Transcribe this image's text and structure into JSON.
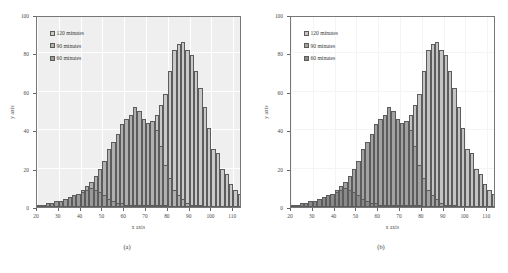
{
  "figure": {
    "panels": [
      {
        "caption": "(a)",
        "background": "#efefef",
        "legend": [
          {
            "label": "120 minutes",
            "color": "#c9c9c9"
          },
          {
            "label": "90 minutes",
            "color": "#b0b0b0"
          },
          {
            "label": "60 minutes",
            "color": "#9a9a9a"
          }
        ],
        "chart_data": {
          "type": "bar",
          "title": "",
          "subtitle": "",
          "xlabel": "x axis",
          "ylabel": "y axis",
          "xlim": [
            20,
            114
          ],
          "ylim": [
            0,
            100
          ],
          "xticks": [
            20,
            30,
            40,
            50,
            60,
            70,
            80,
            90,
            100,
            110
          ],
          "yticks": [
            0,
            20,
            40,
            60,
            80,
            100
          ],
          "grid": true,
          "legend_position": "top-left",
          "bin_width": 2,
          "x": [
            21,
            23,
            25,
            27,
            29,
            31,
            33,
            35,
            37,
            39,
            41,
            43,
            45,
            47,
            49,
            51,
            53,
            55,
            57,
            59,
            61,
            63,
            65,
            67,
            69,
            71,
            73,
            75,
            77,
            79,
            81,
            83,
            85,
            87,
            89,
            91,
            93,
            95,
            97,
            99,
            101,
            103,
            105,
            107,
            109,
            111,
            113
          ],
          "series": [
            {
              "name": "120 minutes",
              "color": "#c9c9c9",
              "values": [
                1,
                1,
                2,
                2,
                3,
                3,
                4,
                5,
                6,
                7,
                9,
                11,
                13,
                16,
                20,
                24,
                30,
                34,
                38,
                43,
                46,
                48,
                52,
                50,
                46,
                44,
                45,
                48,
                53,
                59,
                71,
                82,
                85,
                86,
                82,
                79,
                71,
                62,
                52,
                41,
                30,
                28,
                20,
                17,
                12,
                9,
                7
              ]
            },
            {
              "name": "90 minutes",
              "color": "#b0b0b0",
              "values": [
                1,
                1,
                2,
                2,
                3,
                3,
                4,
                5,
                6,
                7,
                9,
                11,
                13,
                16,
                20,
                24,
                30,
                34,
                38,
                43,
                46,
                48,
                52,
                50,
                46,
                44,
                45,
                40,
                32,
                22,
                15,
                9,
                6,
                4,
                2,
                1,
                1,
                1,
                0,
                0,
                0,
                0,
                0,
                0,
                0,
                0,
                0
              ]
            },
            {
              "name": "60 minutes",
              "color": "#9a9a9a",
              "values": [
                1,
                1,
                2,
                2,
                3,
                3,
                4,
                5,
                6,
                7,
                8,
                9,
                10,
                9,
                8,
                6,
                4,
                3,
                2,
                2,
                1,
                1,
                1,
                1,
                1,
                1,
                1,
                1,
                1,
                1,
                0,
                0,
                0,
                0,
                0,
                0,
                0,
                0,
                0,
                0,
                0,
                0,
                0,
                0,
                0,
                0,
                0
              ]
            }
          ]
        }
      },
      {
        "caption": "(b)",
        "background": "#ffffff",
        "legend": [
          {
            "label": "120 minutes",
            "color": "#c4c4c4"
          },
          {
            "label": "90 minutes",
            "color": "#a2a2a2"
          },
          {
            "label": "60 minutes",
            "color": "#8a8a8a"
          }
        ],
        "chart_data": {
          "type": "bar",
          "title": "",
          "subtitle": "",
          "xlabel": "x axis",
          "ylabel": "y axis",
          "xlim": [
            20,
            114
          ],
          "ylim": [
            0,
            100
          ],
          "xticks": [
            20,
            30,
            40,
            50,
            60,
            70,
            80,
            90,
            100,
            110
          ],
          "yticks": [
            0,
            20,
            40,
            60,
            80,
            100
          ],
          "grid": false,
          "legend_position": "top-left",
          "bin_width": 2,
          "x": [
            21,
            23,
            25,
            27,
            29,
            31,
            33,
            35,
            37,
            39,
            41,
            43,
            45,
            47,
            49,
            51,
            53,
            55,
            57,
            59,
            61,
            63,
            65,
            67,
            69,
            71,
            73,
            75,
            77,
            79,
            81,
            83,
            85,
            87,
            89,
            91,
            93,
            95,
            97,
            99,
            101,
            103,
            105,
            107,
            109,
            111,
            113
          ],
          "series": [
            {
              "name": "120 minutes",
              "color": "#c4c4c4",
              "values": [
                1,
                1,
                2,
                2,
                3,
                3,
                4,
                5,
                6,
                7,
                9,
                11,
                13,
                16,
                20,
                24,
                30,
                34,
                38,
                43,
                46,
                48,
                52,
                50,
                46,
                44,
                45,
                48,
                53,
                59,
                71,
                82,
                85,
                86,
                82,
                79,
                71,
                62,
                52,
                41,
                30,
                28,
                20,
                17,
                12,
                9,
                7
              ]
            },
            {
              "name": "90 minutes",
              "color": "#a2a2a2",
              "values": [
                1,
                1,
                2,
                2,
                3,
                3,
                4,
                5,
                6,
                7,
                9,
                11,
                13,
                16,
                20,
                24,
                30,
                34,
                38,
                43,
                46,
                48,
                52,
                50,
                46,
                44,
                45,
                40,
                32,
                22,
                15,
                9,
                6,
                4,
                2,
                1,
                1,
                1,
                0,
                0,
                0,
                0,
                0,
                0,
                0,
                0,
                0
              ]
            },
            {
              "name": "60 minutes",
              "color": "#8a8a8a",
              "values": [
                1,
                1,
                2,
                2,
                3,
                3,
                4,
                5,
                6,
                7,
                8,
                9,
                10,
                9,
                8,
                6,
                4,
                3,
                2,
                2,
                1,
                1,
                1,
                1,
                1,
                1,
                1,
                1,
                1,
                1,
                0,
                0,
                0,
                0,
                0,
                0,
                0,
                0,
                0,
                0,
                0,
                0,
                0,
                0,
                0,
                0,
                0
              ]
            }
          ]
        }
      }
    ]
  }
}
